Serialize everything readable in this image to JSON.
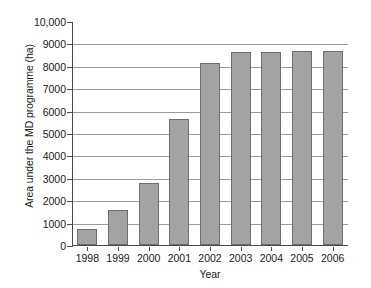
{
  "chart_data": {
    "type": "bar",
    "title": "",
    "xlabel": "Year",
    "ylabel": "Area under the MD programme (ha)",
    "categories": [
      "1998",
      "1999",
      "2000",
      "2001",
      "2002",
      "2003",
      "2004",
      "2005",
      "2006"
    ],
    "values": [
      700,
      1580,
      2750,
      5630,
      8130,
      8600,
      8620,
      8640,
      8650
    ],
    "series": [
      {
        "name": "Area under the MD programme (ha)",
        "values": [
          700,
          1580,
          2750,
          5630,
          8130,
          8600,
          8620,
          8640,
          8650
        ]
      }
    ],
    "ylim": [
      0,
      10000
    ],
    "ytick_values": [
      0,
      1000,
      2000,
      3000,
      4000,
      5000,
      6000,
      7000,
      8000,
      9000,
      10000
    ],
    "ytick_labels": [
      "0",
      "1000",
      "2000",
      "3000",
      "4000",
      "5000",
      "6000",
      "7000",
      "8000",
      "9000",
      "10,000"
    ],
    "grid": "horizontal",
    "legend": "none",
    "bar_color": "#a3a3a3",
    "bar_border_color": "#6e6e6e",
    "gridline_color": "#9b9b9b",
    "axis_color": "#4a4a4a",
    "background_color": "#ffffff"
  }
}
